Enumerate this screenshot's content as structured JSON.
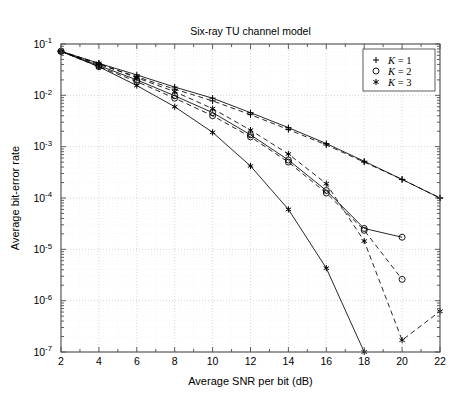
{
  "chart_data": {
    "type": "line",
    "title": "Six-ray TU channel model",
    "xlabel": "Average SNR per bit (dB)",
    "ylabel": "Average bit-error rate",
    "xlim": [
      2,
      22
    ],
    "ylim": [
      1e-07,
      0.1
    ],
    "yscale": "log",
    "grid": true,
    "grid_style": "dotted",
    "xticks": [
      2,
      4,
      6,
      8,
      10,
      12,
      14,
      16,
      18,
      20,
      22
    ],
    "xticklabels": [
      "2",
      "4",
      "6",
      "8",
      "10",
      "12",
      "14",
      "16",
      "18",
      "20",
      "22"
    ],
    "yticks": [
      0.1,
      0.01,
      0.001,
      0.0001,
      1e-05,
      1e-06,
      1e-07
    ],
    "yticklabels": [
      "10^-1",
      "10^-2",
      "10^-3",
      "10^-4",
      "10^-5",
      "10^-6",
      "10^-7"
    ],
    "legend": {
      "position": "upper right",
      "entries": [
        {
          "label": "K = 1",
          "marker": "plus",
          "symbol": "+"
        },
        {
          "label": "K = 2",
          "marker": "circle",
          "symbol": "o"
        },
        {
          "label": "K = 3",
          "marker": "star",
          "symbol": "*"
        }
      ]
    },
    "series": [
      {
        "name": "K = 1 (solid)",
        "marker": "plus",
        "linestyle": "solid",
        "x": [
          2,
          4,
          6,
          8,
          10,
          12,
          14,
          16,
          18,
          20,
          22
        ],
        "y": [
          0.072,
          0.042,
          0.025,
          0.0145,
          0.0088,
          0.0046,
          0.00235,
          0.00115,
          0.00052,
          0.00023,
          0.0001
        ]
      },
      {
        "name": "K = 1 (dashed)",
        "marker": "plus",
        "linestyle": "dashed",
        "x": [
          2,
          4,
          6,
          8,
          10,
          12,
          14,
          16,
          18,
          20,
          22
        ],
        "y": [
          0.072,
          0.04,
          0.023,
          0.0132,
          0.0078,
          0.0042,
          0.00215,
          0.00108,
          0.0005,
          0.00023,
          0.0001
        ]
      },
      {
        "name": "K = 2 (solid)",
        "marker": "circle",
        "linestyle": "solid",
        "x": [
          2,
          4,
          6,
          8,
          10,
          12,
          14,
          16,
          18,
          20
        ],
        "y": [
          0.072,
          0.038,
          0.02,
          0.0098,
          0.0046,
          0.0017,
          0.00055,
          0.00014,
          2.55e-05,
          1.72e-05
        ]
      },
      {
        "name": "K = 2 (dashed)",
        "marker": "circle",
        "linestyle": "dashed",
        "x": [
          2,
          4,
          6,
          8,
          10,
          12,
          14,
          16,
          18,
          20
        ],
        "y": [
          0.072,
          0.036,
          0.0185,
          0.0088,
          0.004,
          0.00155,
          0.0005,
          0.000125,
          2.35e-05,
          2.6e-06
        ]
      },
      {
        "name": "K = 3 (solid)",
        "marker": "star",
        "linestyle": "solid",
        "x": [
          2,
          4,
          6,
          8,
          10,
          12,
          14,
          16,
          18
        ],
        "y": [
          0.072,
          0.036,
          0.0155,
          0.006,
          0.0019,
          0.00042,
          6e-05,
          4.3e-06,
          1e-07
        ]
      },
      {
        "name": "K = 3 (dashed)",
        "marker": "star",
        "linestyle": "dashed",
        "x": [
          2,
          4,
          6,
          8,
          10,
          12,
          14,
          16,
          18,
          20,
          22
        ],
        "y": [
          0.072,
          0.042,
          0.022,
          0.0118,
          0.0055,
          0.0021,
          0.00072,
          0.00019,
          1.45e-05,
          1.7e-07,
          6.2e-07
        ]
      }
    ]
  }
}
